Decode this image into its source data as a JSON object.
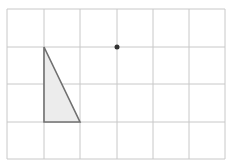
{
  "caption": "",
  "grid": {
    "x": [
      7,
      44,
      80,
      117,
      153,
      189,
      225
    ],
    "y": [
      9,
      47,
      84,
      122,
      159
    ],
    "line_color": "#c8c8c8"
  },
  "triangle": {
    "points": [
      [
        44,
        47
      ],
      [
        44,
        122
      ],
      [
        80,
        122
      ]
    ],
    "fill": "#ececec",
    "stroke": "#707070"
  },
  "point": {
    "x": 117,
    "y": 47,
    "r": 2.5,
    "color": "#333333"
  }
}
